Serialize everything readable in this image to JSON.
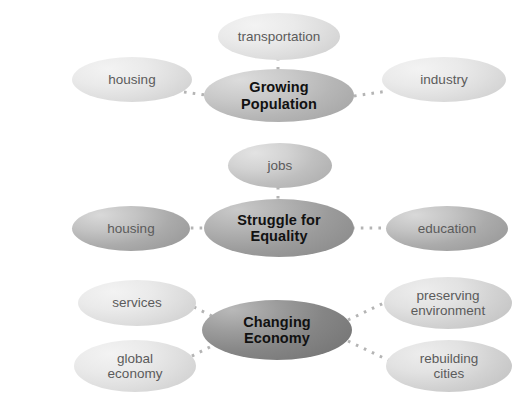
{
  "diagram": {
    "type": "concept-map",
    "background_color": "#ffffff",
    "connector_color": "#b4b4b4",
    "clusters": [
      {
        "id": "growing-population",
        "center": {
          "label": "Growing Population",
          "fill": "#b6b6b6",
          "text_color": "#111111"
        },
        "satellites": [
          {
            "label": "transportation",
            "position": "top",
            "fill": "#dedede",
            "text_color": "#5b5b5b"
          },
          {
            "label": "housing",
            "position": "left",
            "fill": "#dedede",
            "text_color": "#5b5b5b"
          },
          {
            "label": "industry",
            "position": "right",
            "fill": "#dedede",
            "text_color": "#5b5b5b"
          }
        ]
      },
      {
        "id": "struggle-for-equality",
        "center": {
          "label": "Struggle for\nEquality",
          "fill": "#9b9b9b",
          "text_color": "#111111"
        },
        "satellites": [
          {
            "label": "jobs",
            "position": "top",
            "fill": "#bfbfbf",
            "text_color": "#5b5b5b"
          },
          {
            "label": "housing",
            "position": "left",
            "fill": "#ababab",
            "text_color": "#5b5b5b"
          },
          {
            "label": "education",
            "position": "right",
            "fill": "#ababab",
            "text_color": "#5b5b5b"
          }
        ]
      },
      {
        "id": "changing-economy",
        "center": {
          "label": "Changing\nEconomy",
          "fill": "#858585",
          "text_color": "#111111"
        },
        "satellites": [
          {
            "label": "services",
            "position": "top-left",
            "fill": "#dedede",
            "text_color": "#5b5b5b"
          },
          {
            "label": "global\neconomy",
            "position": "bottom-left",
            "fill": "#dedede",
            "text_color": "#5b5b5b"
          },
          {
            "label": "preserving\nenvironment",
            "position": "top-right",
            "fill": "#d2d2d2",
            "text_color": "#5b5b5b"
          },
          {
            "label": "rebuilding\ncities",
            "position": "bottom-right",
            "fill": "#d2d2d2",
            "text_color": "#5b5b5b"
          }
        ]
      }
    ]
  }
}
